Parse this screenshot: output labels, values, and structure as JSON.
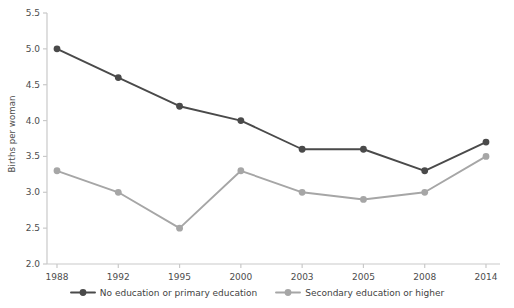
{
  "chart_data": {
    "type": "line",
    "title": "",
    "xlabel": "",
    "ylabel": "Births per woman",
    "categories": [
      "1988",
      "1992",
      "1995",
      "2000",
      "2003",
      "2005",
      "2008",
      "2014"
    ],
    "ylim": [
      2.0,
      5.5
    ],
    "yticks": [
      "2.0",
      "2.5",
      "3.0",
      "3.5",
      "4.0",
      "4.5",
      "5.0",
      "5.5"
    ],
    "ytick_values": [
      2.0,
      2.5,
      3.0,
      3.5,
      4.0,
      4.5,
      5.0,
      5.5
    ],
    "grid": false,
    "legend_position": "bottom-center",
    "series": [
      {
        "name": "No education or primary education",
        "color": "#4a4a4a",
        "marker": "circle",
        "values": [
          5.0,
          4.6,
          4.2,
          4.0,
          3.6,
          3.6,
          3.3,
          3.7
        ]
      },
      {
        "name": "Secondary education or higher",
        "color": "#a6a6a6",
        "marker": "circle",
        "values": [
          3.3,
          3.0,
          2.5,
          3.3,
          3.0,
          2.9,
          3.0,
          3.5
        ]
      }
    ]
  },
  "axes": {
    "axis_line_color": "#c9c9c9",
    "tick_color": "#c9c9c9",
    "label_color": "#4d4d4d"
  },
  "legend": {
    "items": [
      {
        "label": "No education or primary education",
        "color": "#4a4a4a"
      },
      {
        "label": "Secondary education or higher",
        "color": "#a6a6a6"
      }
    ]
  }
}
